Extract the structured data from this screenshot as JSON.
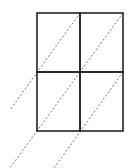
{
  "diagram": {
    "grid": {
      "rows": 2,
      "cols": 2,
      "x": [
        37,
        80,
        123
      ],
      "y": [
        13,
        72,
        131
      ],
      "stroke": "#222222",
      "stroke_width": 1.6
    },
    "diagonals": [
      {
        "x1": 80,
        "y1": 13,
        "x2": 10,
        "y2": 110
      },
      {
        "x1": 123,
        "y1": 13,
        "x2": 80,
        "y2": 72
      },
      {
        "x1": 80,
        "y1": 72,
        "x2": 10,
        "y2": 168
      },
      {
        "x1": 123,
        "y1": 72,
        "x2": 54,
        "y2": 168
      }
    ],
    "diagonal_style": {
      "stroke": "#666666",
      "dash": "2,2",
      "stroke_width": 0.9
    }
  }
}
